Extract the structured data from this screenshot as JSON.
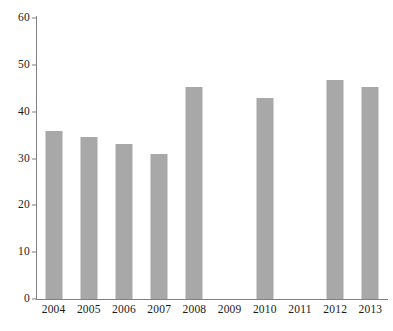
{
  "chart_data": {
    "type": "bar",
    "title": "",
    "subtitle": "",
    "xlabel": "",
    "ylabel": "",
    "categories": [
      "2004",
      "2005",
      "2006",
      "2007",
      "2008",
      "2009",
      "2010",
      "2011",
      "2012",
      "2013"
    ],
    "values": [
      35.8,
      34.6,
      33.0,
      31.0,
      45.3,
      null,
      43.0,
      null,
      46.7,
      45.2
    ],
    "ylim": [
      0,
      60
    ],
    "yticks": [
      0,
      10,
      20,
      30,
      40,
      50,
      60
    ],
    "ytick_labels": [
      "0",
      "10",
      "20",
      "30",
      "40",
      "50",
      "60"
    ],
    "grid": false,
    "legend": null,
    "legend_position": "none",
    "bar_color": "#a8a8a8",
    "axis_color": "#808080",
    "text_color": "#1a1a1a",
    "missing_categories": [
      "2009",
      "2011"
    ]
  }
}
